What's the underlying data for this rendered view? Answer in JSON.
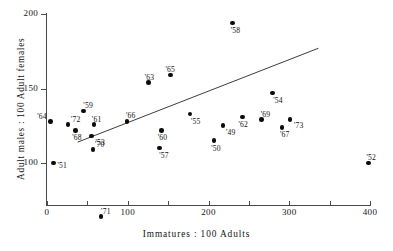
{
  "chart_data": {
    "type": "scatter",
    "title": "",
    "xlabel": "Immatures : 100 Adults",
    "ylabel": "Adult males : 100 Adult females",
    "xlim": [
      0,
      440
    ],
    "ylim": [
      60,
      200
    ],
    "grid": false,
    "legend": null,
    "xticks": [
      0,
      50,
      100,
      150,
      200,
      250,
      300,
      350,
      400
    ],
    "xticklabels": [
      "0",
      "",
      "100",
      "",
      "200",
      "",
      "300",
      "",
      "400"
    ],
    "yticks": [
      100,
      150,
      200
    ],
    "yticklabels": [
      "100",
      "150",
      "200"
    ],
    "point_label_prefix": "'",
    "points": [
      {
        "label": "'64",
        "x": 4,
        "y": 128,
        "lx": -13,
        "ly": -9
      },
      {
        "label": "'72",
        "x": 26,
        "y": 126,
        "lx": 3,
        "ly": -9
      },
      {
        "label": "'68",
        "x": 35,
        "y": 122,
        "lx": -3,
        "ly": 3
      },
      {
        "label": "'59",
        "x": 45,
        "y": 135,
        "lx": 0,
        "ly": -10
      },
      {
        "label": "'61",
        "x": 58,
        "y": 126,
        "lx": -2,
        "ly": -9
      },
      {
        "label": "'53",
        "x": 55,
        "y": 118,
        "lx": 4,
        "ly": 2
      },
      {
        "label": "'70",
        "x": 57,
        "y": 109,
        "lx": 2,
        "ly": -10
      },
      {
        "label": "'51",
        "x": 8,
        "y": 100,
        "lx": 4,
        "ly": -2
      },
      {
        "label": "'71",
        "x": 67,
        "y": 64,
        "lx": 0,
        "ly": -10
      },
      {
        "label": "'66",
        "x": 99,
        "y": 128,
        "lx": -1,
        "ly": -10
      },
      {
        "label": "'63",
        "x": 126,
        "y": 154,
        "lx": -4,
        "ly": -10
      },
      {
        "label": "'65",
        "x": 153,
        "y": 159,
        "lx": -5,
        "ly": -10
      },
      {
        "label": "'60",
        "x": 142,
        "y": 122,
        "lx": -4,
        "ly": 3
      },
      {
        "label": "'57",
        "x": 139,
        "y": 110,
        "lx": 0,
        "ly": 3
      },
      {
        "label": "'55",
        "x": 177,
        "y": 133,
        "lx": 1,
        "ly": 3
      },
      {
        "label": "'58",
        "x": 230,
        "y": 194,
        "lx": -2,
        "ly": 3
      },
      {
        "label": "'50",
        "x": 207,
        "y": 115,
        "lx": -3,
        "ly": 3
      },
      {
        "label": "'49",
        "x": 218,
        "y": 125,
        "lx": 3,
        "ly": 2
      },
      {
        "label": "'62",
        "x": 242,
        "y": 131,
        "lx": -4,
        "ly": 3
      },
      {
        "label": "'69",
        "x": 266,
        "y": 129,
        "lx": -1,
        "ly": -10
      },
      {
        "label": "'54",
        "x": 279,
        "y": 147,
        "lx": 1,
        "ly": 3
      },
      {
        "label": "'67",
        "x": 291,
        "y": 124,
        "lx": -2,
        "ly": 3
      },
      {
        "label": "'73",
        "x": 301,
        "y": 129,
        "lx": 4,
        "ly": 1
      },
      {
        "label": "'52",
        "x": 398,
        "y": 100,
        "lx": -2,
        "ly": -10
      }
    ],
    "trend_line": {
      "x_start": 38,
      "y_start": 114,
      "x_end": 336,
      "y_end": 177
    }
  }
}
